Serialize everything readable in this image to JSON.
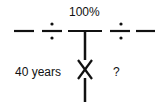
{
  "diagram": {
    "top_label": "100%",
    "left_label": "40 years",
    "right_label": "?",
    "colors": {
      "ink": "#111111",
      "background": "#ffffff"
    },
    "elements": [
      "dash-segment",
      "division-sign",
      "t-junction-bar",
      "division-sign",
      "dash-segment",
      "x-cross-on-stem"
    ]
  }
}
